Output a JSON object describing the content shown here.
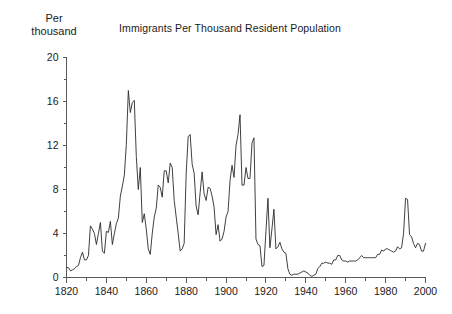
{
  "chart_data": {
    "type": "line",
    "title": "Immigrants Per Thousand Resident Population",
    "ylabel": "Per\nthousand",
    "xlabel": "",
    "xlim": [
      1820,
      2000
    ],
    "ylim": [
      0,
      20
    ],
    "grid": false,
    "legend": null,
    "y_ticks_major": [
      0,
      4,
      8,
      12,
      16,
      20
    ],
    "y_ticks_minor": [
      2,
      6,
      10,
      14,
      18
    ],
    "x_ticks_major": [
      1820,
      1840,
      1860,
      1880,
      1900,
      1920,
      1940,
      1960,
      1980,
      2000
    ],
    "x_ticks_minor": [
      1830,
      1850,
      1870,
      1890,
      1910,
      1930,
      1950,
      1970,
      1990
    ],
    "series_name": "Immigrants per thousand residents",
    "x": [
      1820,
      1821,
      1822,
      1823,
      1824,
      1825,
      1826,
      1827,
      1828,
      1829,
      1830,
      1831,
      1832,
      1833,
      1834,
      1835,
      1836,
      1837,
      1838,
      1839,
      1840,
      1841,
      1842,
      1843,
      1844,
      1845,
      1846,
      1847,
      1848,
      1849,
      1850,
      1851,
      1852,
      1853,
      1854,
      1855,
      1856,
      1857,
      1858,
      1859,
      1860,
      1861,
      1862,
      1863,
      1864,
      1865,
      1866,
      1867,
      1868,
      1869,
      1870,
      1871,
      1872,
      1873,
      1874,
      1875,
      1876,
      1877,
      1878,
      1879,
      1880,
      1881,
      1882,
      1883,
      1884,
      1885,
      1886,
      1887,
      1888,
      1889,
      1890,
      1891,
      1892,
      1893,
      1894,
      1895,
      1896,
      1897,
      1898,
      1899,
      1900,
      1901,
      1902,
      1903,
      1904,
      1905,
      1906,
      1907,
      1908,
      1909,
      1910,
      1911,
      1912,
      1913,
      1914,
      1915,
      1916,
      1917,
      1918,
      1919,
      1920,
      1921,
      1922,
      1923,
      1924,
      1925,
      1926,
      1927,
      1928,
      1929,
      1930,
      1931,
      1932,
      1933,
      1934,
      1935,
      1936,
      1937,
      1938,
      1939,
      1940,
      1941,
      1942,
      1943,
      1944,
      1945,
      1946,
      1947,
      1948,
      1949,
      1950,
      1951,
      1952,
      1953,
      1954,
      1955,
      1956,
      1957,
      1958,
      1959,
      1960,
      1961,
      1962,
      1963,
      1964,
      1965,
      1966,
      1967,
      1968,
      1969,
      1970,
      1971,
      1972,
      1973,
      1974,
      1975,
      1976,
      1977,
      1978,
      1979,
      1980,
      1981,
      1982,
      1983,
      1984,
      1985,
      1986,
      1987,
      1988,
      1989,
      1990,
      1991,
      1992,
      1993,
      1994,
      1995,
      1996,
      1997,
      1998,
      1999,
      2000
    ],
    "values": [
      0.9,
      0.9,
      0.6,
      0.7,
      0.8,
      1.0,
      1.1,
      1.8,
      2.3,
      1.6,
      1.6,
      2.0,
      4.7,
      4.4,
      4.0,
      3.0,
      4.0,
      5.0,
      2.4,
      2.2,
      4.2,
      4.1,
      5.1,
      3.0,
      4.0,
      4.9,
      5.4,
      7.4,
      8.3,
      9.3,
      12.1,
      17.0,
      15.0,
      15.9,
      16.1,
      11.0,
      8.0,
      10.0,
      5.0,
      5.8,
      4.4,
      2.6,
      2.1,
      4.0,
      5.5,
      6.3,
      8.4,
      8.2,
      7.3,
      9.7,
      9.7,
      8.6,
      10.4,
      10.0,
      7.0,
      5.5,
      4.0,
      2.4,
      2.6,
      3.1,
      9.4,
      12.8,
      13.0,
      10.3,
      9.5,
      6.5,
      5.7,
      7.7,
      9.6,
      7.6,
      7.0,
      8.2,
      8.1,
      7.4,
      6.4,
      3.9,
      4.8,
      3.3,
      3.5,
      4.2,
      5.5,
      6.0,
      8.8,
      10.2,
      9.1,
      12.0,
      13.0,
      14.8,
      8.4,
      8.4,
      10.0,
      9.0,
      9.0,
      12.2,
      12.7,
      3.5,
      3.0,
      2.9,
      1.0,
      1.1,
      4.2,
      7.2,
      2.7,
      4.4,
      6.2,
      2.6,
      2.8,
      3.2,
      2.6,
      2.3,
      2.2,
      0.8,
      0.3,
      0.2,
      0.3,
      0.3,
      0.3,
      0.4,
      0.5,
      0.6,
      0.5,
      0.4,
      0.2,
      0.1,
      0.2,
      0.3,
      0.8,
      1.0,
      1.3,
      1.3,
      1.4,
      1.3,
      1.3,
      1.2,
      1.6,
      1.6,
      2.0,
      2.0,
      1.6,
      1.5,
      1.5,
      1.4,
      1.5,
      1.5,
      1.5,
      1.5,
      1.6,
      1.8,
      2.0,
      1.8,
      1.8,
      1.8,
      1.8,
      1.8,
      1.8,
      1.8,
      2.1,
      2.1,
      2.5,
      2.4,
      2.6,
      2.6,
      2.5,
      2.4,
      2.3,
      2.4,
      2.8,
      2.6,
      2.7,
      4.0,
      7.2,
      7.1,
      3.9,
      3.7,
      3.1,
      2.7,
      3.1,
      3.0,
      2.4,
      2.4,
      3.1
    ]
  },
  "axis_color": "#5a5a5a",
  "line_color": "#2a2a2a",
  "background_color": "#ffffff"
}
